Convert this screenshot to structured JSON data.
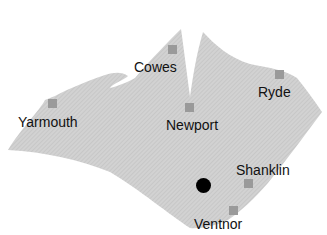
{
  "map": {
    "title": "Isle of Wight",
    "colors": {
      "land": "#cfcfcf",
      "land_hatch": "#bdbdbd",
      "sea": "#ffffff",
      "town_marker": "#9a9a9a",
      "location_dot": "#000000",
      "label": "#111111"
    },
    "towns": [
      {
        "name": "Cowes",
        "marker": {
          "x": 168,
          "y": 45
        },
        "label": {
          "x": 134,
          "y": 60
        }
      },
      {
        "name": "Yarmouth",
        "marker": {
          "x": 48,
          "y": 99
        },
        "label": {
          "x": 18,
          "y": 115
        }
      },
      {
        "name": "Newport",
        "marker": {
          "x": 185,
          "y": 103
        },
        "label": {
          "x": 166,
          "y": 118
        }
      },
      {
        "name": "Ryde",
        "marker": {
          "x": 275,
          "y": 70
        },
        "label": {
          "x": 258,
          "y": 85
        }
      },
      {
        "name": "Shanklin",
        "marker": {
          "x": 244,
          "y": 179
        },
        "label": {
          "x": 236,
          "y": 163
        }
      },
      {
        "name": "Ventnor",
        "marker": {
          "x": 229,
          "y": 206
        },
        "label": {
          "x": 194,
          "y": 217
        }
      }
    ],
    "current_location": {
      "x": 203,
      "y": 185
    }
  }
}
